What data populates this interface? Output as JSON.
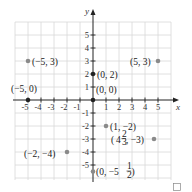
{
  "diagram": {
    "type": "coordinate-plane",
    "axes": {
      "x_label": "x",
      "y_label": "y",
      "x_ticks": [
        "-5",
        "-4",
        "-3",
        "-2",
        "-1",
        "1",
        "2",
        "3",
        "4",
        "5"
      ],
      "y_ticks": [
        "5",
        "4",
        "3",
        "2",
        "1",
        "-1",
        "-2",
        "-3",
        "-4",
        "-5"
      ],
      "range": [
        -6,
        6
      ]
    },
    "points": [
      {
        "x": -5,
        "y": 3,
        "label": "(−5, 3)"
      },
      {
        "x": 5,
        "y": 3,
        "label": "(5, 3)"
      },
      {
        "x": 0,
        "y": 2,
        "label": "(0, 2)"
      },
      {
        "x": 0,
        "y": 0,
        "label": "(0, 0)"
      },
      {
        "x": -5,
        "y": 0,
        "label": "(−5, 0)"
      },
      {
        "x": 1,
        "y": -2,
        "label": "(1, −2)"
      },
      {
        "x": 4.6667,
        "y": -3,
        "label_whole": "4",
        "label_num": "2",
        "label_den": "3",
        "label_rest": ", −3)"
      },
      {
        "x": -2,
        "y": -4,
        "label": "(−2, −4)"
      },
      {
        "x": 0,
        "y": -5.5,
        "label_prefix": "(0, −5",
        "label_num": "1",
        "label_den": "2",
        "label_suffix": ")"
      }
    ],
    "colors": {
      "grid": "#d8d8d8",
      "axis": "#222222",
      "point": "#8a8a8a",
      "text": "#222222"
    }
  }
}
